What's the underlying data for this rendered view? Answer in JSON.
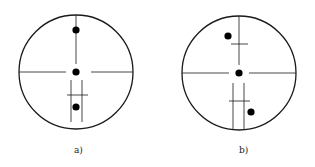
{
  "figure": {
    "panels": [
      {
        "id": "a",
        "label": "a)",
        "description": "Reticle crosshair with three dots aligned on the vertical axis; lower double-line bracket with horizontal tick",
        "circle": {
          "cx": 76,
          "cy": 72,
          "r": 57
        },
        "dots": [
          {
            "cx": 76,
            "cy": 30
          },
          {
            "cx": 76,
            "cy": 72
          },
          {
            "cx": 76,
            "cy": 107
          }
        ]
      },
      {
        "id": "b",
        "label": "b)",
        "description": "Reticle crosshair with offset dots; upper tick on vertical line, lower double-line bracket with horizontal tick",
        "circle": {
          "cx": 239,
          "cy": 73,
          "r": 57
        },
        "dots": [
          {
            "cx": 228,
            "cy": 36
          },
          {
            "cx": 239,
            "cy": 73
          },
          {
            "cx": 250,
            "cy": 112
          }
        ]
      }
    ],
    "colors": {
      "stroke": "#1a1a1a",
      "dot": "#000000",
      "background": "#ffffff"
    }
  }
}
